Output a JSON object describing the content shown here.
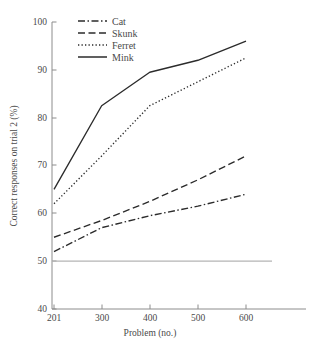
{
  "chart_data": {
    "type": "line",
    "title": "",
    "xlabel": "Problem (no.)",
    "ylabel": "Correct responses on trial 2 (%)",
    "x": [
      201,
      300,
      400,
      500,
      600
    ],
    "xtick_labels": [
      "201",
      "300",
      "400",
      "500",
      "600"
    ],
    "ytick_labels": [
      "40",
      "50",
      "60",
      "70",
      "80",
      "90",
      "100"
    ],
    "yticks": [
      40,
      50,
      60,
      70,
      80,
      90,
      100
    ],
    "xlim": [
      201,
      600
    ],
    "ylim": [
      40,
      100
    ],
    "grid": false,
    "legend_position": "top-center",
    "reference_line": {
      "name": "chance-level",
      "value": 50,
      "color": "#b4b4b4"
    },
    "series": [
      {
        "name": "Cat",
        "style": "dash-dot",
        "color": "#2b2b2b",
        "values": [
          52,
          57,
          59.5,
          61.5,
          64
        ]
      },
      {
        "name": "Skunk",
        "style": "dashed",
        "color": "#2b2b2b",
        "values": [
          55,
          58.5,
          62.5,
          67,
          72
        ]
      },
      {
        "name": "Ferret",
        "style": "dotted",
        "color": "#2b2b2b",
        "values": [
          62,
          72,
          82.5,
          87.5,
          92.5
        ]
      },
      {
        "name": "Mink",
        "style": "solid",
        "color": "#2b2b2b",
        "values": [
          65,
          82.5,
          89.5,
          92,
          96
        ]
      }
    ]
  },
  "axes": {
    "y_title": "Correct responses on trial 2 (%)",
    "x_title": "Problem (no.)",
    "y_tick_0": "40",
    "y_tick_1": "50",
    "y_tick_2": "60",
    "y_tick_3": "70",
    "y_tick_4": "80",
    "y_tick_5": "90",
    "y_tick_6": "100",
    "x_tick_0": "201",
    "x_tick_1": "300",
    "x_tick_2": "400",
    "x_tick_3": "500",
    "x_tick_4": "600"
  },
  "legend": {
    "entries": [
      {
        "label": "Cat"
      },
      {
        "label": "Skunk"
      },
      {
        "label": "Ferret"
      },
      {
        "label": "Mink"
      }
    ]
  }
}
